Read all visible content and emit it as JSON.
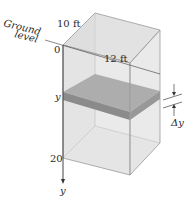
{
  "diagram": {
    "labels": {
      "ground_line1": "Ground",
      "ground_line2": "level",
      "width_dim": "10 ft",
      "length_dim": "12 ft",
      "origin": "0",
      "depth_bottom": "20",
      "slab_depth": "y",
      "axis": "y",
      "thickness": "Δy"
    },
    "colors": {
      "box_fill": "#e6e6e6",
      "box_edge": "#9a9a9a",
      "slab_top": "#8e8e8e",
      "slab_side": "#5a5a5a",
      "text": "#2a2a2a"
    }
  }
}
